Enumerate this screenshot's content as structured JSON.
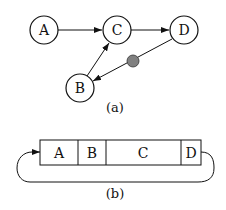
{
  "figure_a": {
    "caption": "(a)",
    "nodes": [
      {
        "id": "A",
        "label": "A",
        "cx": 44,
        "cy": 30
      },
      {
        "id": "C",
        "label": "C",
        "cx": 117,
        "cy": 30
      },
      {
        "id": "D",
        "label": "D",
        "cx": 184,
        "cy": 30
      },
      {
        "id": "B",
        "label": "B",
        "cx": 80,
        "cy": 88
      }
    ],
    "edges": [
      {
        "from": "A",
        "to": "C"
      },
      {
        "from": "C",
        "to": "D"
      },
      {
        "from": "B",
        "to": "C"
      },
      {
        "from": "D",
        "to": "B",
        "marker": "gray-dot"
      }
    ],
    "marker_color": "#808080"
  },
  "figure_b": {
    "caption": "(b)",
    "cells": [
      {
        "label": "A"
      },
      {
        "label": "B"
      },
      {
        "label": "C"
      },
      {
        "label": "D"
      }
    ]
  }
}
